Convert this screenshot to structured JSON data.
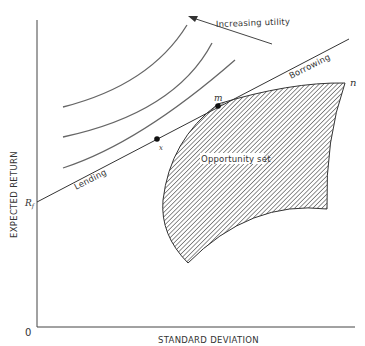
{
  "diagram": {
    "type": "capital-market-line / portfolio choice diagram",
    "axes": {
      "x_label": "STANDARD DEVIATION",
      "y_label": "EXPECTED RETURN",
      "origin_label": "0"
    },
    "points": {
      "risk_free": "R",
      "risk_free_sub": "f",
      "tangency_x": "x",
      "market": "m",
      "frontier_end": "n"
    },
    "line_labels": {
      "lending": "Lending",
      "borrowing": "Borrowing"
    },
    "region_label": "Opportunity set",
    "arrow_label": "Increasing utility",
    "indifference_curves": 3,
    "colors": {
      "ink": "#333333",
      "curves": "#666666",
      "hatch": "#555555",
      "background": "#ffffff"
    }
  }
}
